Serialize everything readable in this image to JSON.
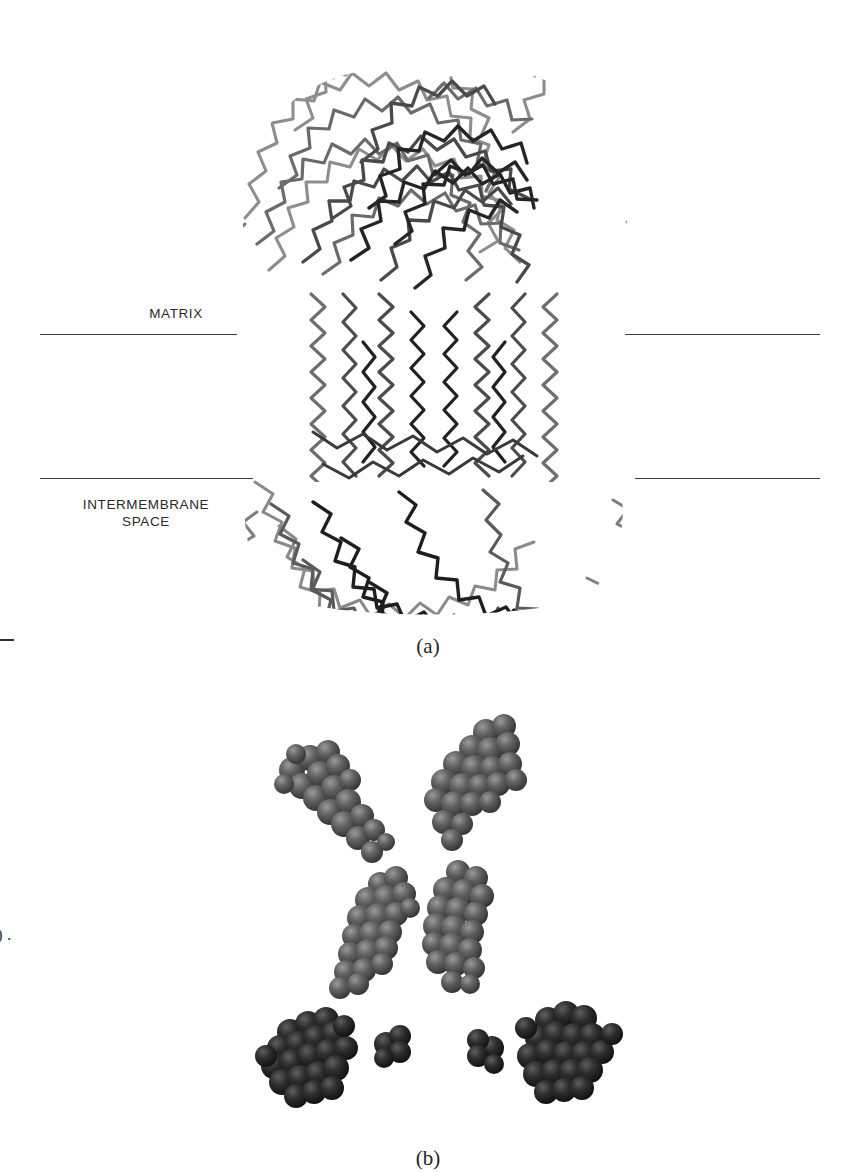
{
  "figure": {
    "background_color": "#ffffff",
    "ink_color": "#2b2b2b"
  },
  "panel_a": {
    "caption": "(a)",
    "labels": {
      "matrix": "MATRIX",
      "intermembrane_space": "INTERMEMBRANE\nSPACE"
    },
    "membrane_lines": [
      {
        "name": "upper-left",
        "x1": 40,
        "x2": 237,
        "y": 334
      },
      {
        "name": "upper-right",
        "x1": 625,
        "x2": 820,
        "y": 334
      },
      {
        "name": "lower-left",
        "x1": 40,
        "x2": 253,
        "y": 478
      },
      {
        "name": "lower-right",
        "x1": 635,
        "x2": 820,
        "y": 478
      }
    ],
    "rendering": {
      "style": "c-alpha-backbone-trace",
      "description": "Mushroom-shaped membrane protein complex drawn as a dense grey-to-black polyline worm trace; broad globular head above the membrane, vertical helical bundle spanning the bilayer, and a dense globular domain below.",
      "trace_colors": [
        "#1c1c1c",
        "#3d3d3d",
        "#5e5e5e",
        "#7c7c7c",
        "#969696"
      ]
    }
  },
  "panel_b": {
    "caption": "(b)",
    "rendering": {
      "style": "space-filling-cpk-spheres",
      "description": "Six isolated cofactor groups shown as shaded space-filling sphere clusters, arranged with approximate two-fold symmetry: an upper pair of tilted elongated groups, a middle pair of vertical elongated groups, and a lower pair of large dense clusters each accompanied by one small single sphere.",
      "sphere_color_light": "#8d8d8d",
      "sphere_color_mid": "#585858",
      "sphere_color_dark": "#2a2a2a",
      "sphere_color_darkest": "#141414"
    },
    "cofactor_groups": [
      {
        "name": "upper-left-group",
        "cx": 367,
        "cy": 793,
        "orientation": "tilted-down-right",
        "shade": "mid",
        "sphere_count": 26
      },
      {
        "name": "upper-right-group",
        "cx": 478,
        "cy": 772,
        "orientation": "tilted-down-left",
        "shade": "mid",
        "sphere_count": 30
      },
      {
        "name": "middle-left-group",
        "cx": 378,
        "cy": 900,
        "orientation": "vertical",
        "shade": "mid",
        "sphere_count": 28
      },
      {
        "name": "middle-right-group",
        "cx": 467,
        "cy": 895,
        "orientation": "vertical",
        "shade": "mid",
        "sphere_count": 30
      },
      {
        "name": "lower-left-cluster",
        "cx": 310,
        "cy": 1040,
        "orientation": "globular",
        "shade": "dark",
        "sphere_count": 34
      },
      {
        "name": "lower-left-satellite",
        "cx": 380,
        "cy": 1030,
        "orientation": "single",
        "shade": "dark",
        "sphere_count": 4
      },
      {
        "name": "lower-right-satellite",
        "cx": 485,
        "cy": 1038,
        "orientation": "single",
        "shade": "dark",
        "sphere_count": 4
      },
      {
        "name": "lower-right-cluster",
        "cx": 560,
        "cy": 1045,
        "orientation": "globular",
        "shade": "dark",
        "sphere_count": 34
      }
    ]
  },
  "margin_artifacts": {
    "rule_mark": "",
    "glyphs": ")\n."
  }
}
